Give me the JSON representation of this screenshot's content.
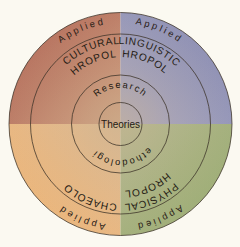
{
  "diagram": {
    "shape": "concentric-circles",
    "background_color": "#fbf9f1",
    "outline_color": "#3b3228",
    "center": {
      "label": "Theories"
    },
    "rings": [
      {
        "index": 1,
        "name": "core-ring",
        "labels": [
          "Theories"
        ]
      },
      {
        "index": 2,
        "name": "method-ring",
        "labels": [
          "Research",
          "Methodologies"
        ],
        "top_label": "Research",
        "bottom_label": "Methodologies"
      },
      {
        "index": 3,
        "name": "subfield-ring",
        "labels": [
          "CULTURAL ANTHROPOLOGY",
          "LINGUISTIC ANTHROPOLOGY",
          "ARCHAEOLOGY",
          "PHYSICAL ANTHROPOLOGY"
        ]
      },
      {
        "index": 4,
        "name": "applied-ring",
        "labels": [
          "Applied",
          "Applied",
          "Applied",
          "Applied"
        ]
      }
    ],
    "quadrants": [
      {
        "position": "top-left",
        "subfield_line1": "CULTURAL",
        "subfield_line2": "ANTHROPOLOGY",
        "applied": "Applied",
        "color": "#b5705f"
      },
      {
        "position": "top-right",
        "subfield_line1": "LINGUISTIC",
        "subfield_line2": "ANTHROPOLOGY",
        "applied": "Applied",
        "color": "#8a8bb0"
      },
      {
        "position": "bottom-left",
        "subfield_line1": "ARCHAEOLOGY",
        "subfield_line2": "",
        "applied": "Applied",
        "color": "#e8b071"
      },
      {
        "position": "bottom-right",
        "subfield_line1": "PHYSICAL",
        "subfield_line2": "ANTHROPOLOGY",
        "applied": "Applied",
        "color": "#9aab72"
      }
    ]
  }
}
